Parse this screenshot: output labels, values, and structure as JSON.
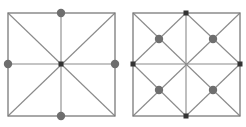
{
  "colors": {
    "background": "#ffffff",
    "line": "#8a8a8a",
    "frame": "#7a7a7a",
    "dot": "#6e6e6e",
    "marker": "#333333"
  },
  "panels": [
    {
      "name": "left-square",
      "box": {
        "x": 8,
        "y": 13,
        "w": 107,
        "h": 103
      },
      "center": {
        "x": 61,
        "y": 64
      },
      "lines": [
        [
          8,
          13,
          115,
          116
        ],
        [
          115,
          13,
          8,
          116
        ],
        [
          61,
          13,
          61,
          116
        ],
        [
          8,
          64,
          115,
          64
        ]
      ],
      "dots": [
        {
          "x": 61,
          "y": 13
        },
        {
          "x": 8,
          "y": 64
        },
        {
          "x": 115,
          "y": 64
        },
        {
          "x": 61,
          "y": 116
        }
      ],
      "markers": [
        {
          "x": 61,
          "y": 64
        }
      ]
    },
    {
      "name": "right-square",
      "box": {
        "x": 133,
        "y": 13,
        "w": 107,
        "h": 103
      },
      "center": {
        "x": 186,
        "y": 64
      },
      "lines": [
        [
          133,
          13,
          240,
          116
        ],
        [
          240,
          13,
          133,
          116
        ],
        [
          186,
          13,
          186,
          116
        ],
        [
          133,
          64,
          240,
          64
        ],
        [
          186,
          13,
          133,
          64
        ],
        [
          133,
          64,
          186,
          116
        ],
        [
          186,
          116,
          240,
          64
        ],
        [
          240,
          64,
          186,
          13
        ]
      ],
      "dots": [
        {
          "x": 159,
          "y": 39
        },
        {
          "x": 213,
          "y": 39
        },
        {
          "x": 159,
          "y": 90
        },
        {
          "x": 213,
          "y": 90
        }
      ],
      "markers": [
        {
          "x": 186,
          "y": 13
        },
        {
          "x": 133,
          "y": 64
        },
        {
          "x": 240,
          "y": 64
        },
        {
          "x": 186,
          "y": 116
        }
      ]
    }
  ]
}
